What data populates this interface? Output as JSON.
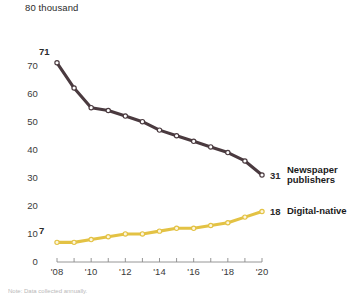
{
  "chart_data": {
    "type": "line",
    "title": "",
    "subtitle": "",
    "xlabel": "",
    "ylabel": "",
    "y_unit_label": "80 thousand",
    "ylim": [
      0,
      80
    ],
    "xlim": [
      2008,
      2020
    ],
    "grid": false,
    "legend_position": "right-inline-labels",
    "y_ticks": [
      "0",
      "10",
      "20",
      "30",
      "40",
      "50",
      "60",
      "70"
    ],
    "y_tick_values": [
      0,
      10,
      20,
      30,
      40,
      50,
      60,
      70
    ],
    "x": [
      2008,
      2009,
      2010,
      2011,
      2012,
      2013,
      2014,
      2015,
      2016,
      2017,
      2018,
      2019,
      2020
    ],
    "x_tick_labels": [
      "'08",
      "'10",
      "'12",
      "'14",
      "'16",
      "'18",
      "'20"
    ],
    "x_tick_label_values": [
      2008,
      2010,
      2012,
      2014,
      2016,
      2018,
      2020
    ],
    "series": [
      {
        "name": "Newspaper publishers",
        "color": "#4a3a3f",
        "marker_fill": "#ffffff",
        "values": [
          71,
          62,
          55,
          54,
          52,
          50,
          47,
          45,
          43,
          41,
          39,
          36,
          31
        ],
        "start_label": "71",
        "end_label": "31",
        "label_lines": [
          "Newspaper",
          "publishers"
        ]
      },
      {
        "name": "Digital-native",
        "color": "#e3c244",
        "marker_fill": "#fdf6dd",
        "values": [
          7,
          7,
          8,
          9,
          10,
          10,
          11,
          12,
          12,
          13,
          14,
          16,
          18
        ],
        "start_label": "7",
        "end_label": "18",
        "label_lines": [
          "Digital-native"
        ]
      }
    ],
    "footnote": "Note: Data collected annually."
  }
}
